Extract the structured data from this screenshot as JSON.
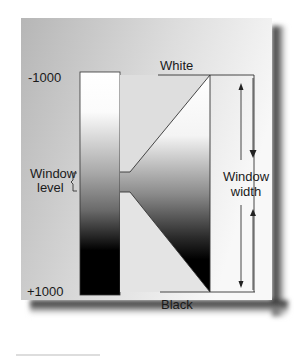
{
  "diagram": {
    "scale": {
      "top_label": "-1000",
      "bottom_label": "+1000"
    },
    "labels": {
      "white": "White",
      "black": "Black",
      "window_level_line1": "Window",
      "window_level_line2": "level",
      "window_width_line1": "Window",
      "window_width_line2": "width"
    },
    "colors": {
      "panel_gradient_left": "#b9b9b9",
      "panel_gradient_right": "#f7f7f7",
      "shadow": "#3a3a3a",
      "outline": "#333333",
      "white": "#ffffff",
      "black": "#000000"
    }
  }
}
